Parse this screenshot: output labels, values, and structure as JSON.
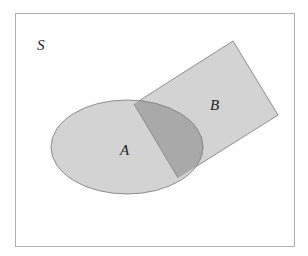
{
  "diagram": {
    "type": "venn",
    "universe": {
      "label": "S"
    },
    "sets": [
      {
        "label": "A",
        "shape": "ellipse"
      },
      {
        "label": "B",
        "shape": "rotated-rectangle"
      }
    ],
    "intersection": {
      "sets": [
        "A",
        "B"
      ],
      "shaded": true
    },
    "colors": {
      "region_fill": "#d3d3d3",
      "intersection_fill": "#a9a9a9",
      "stroke": "#8c8c8c",
      "frame": "#b0b0b0"
    }
  }
}
